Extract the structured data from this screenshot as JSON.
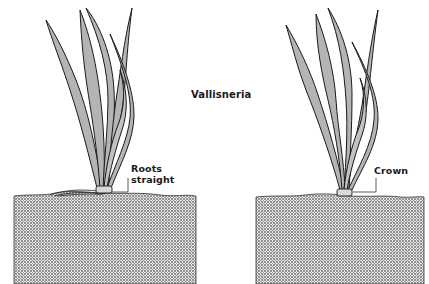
{
  "diagram": {
    "title": "Vallisneria",
    "colors": {
      "leaf_fill": "#b4b4b4",
      "outline": "#1a1a1a",
      "soil": "#9a9a9a",
      "background": "#ffffff"
    },
    "plants": [
      {
        "id": "left",
        "label_lines": [
          "Roots",
          "straight"
        ],
        "feature": "roots spread horizontally along soil surface"
      },
      {
        "id": "right",
        "label_lines": [
          "Crown"
        ],
        "feature": "crown at soil level"
      }
    ]
  }
}
